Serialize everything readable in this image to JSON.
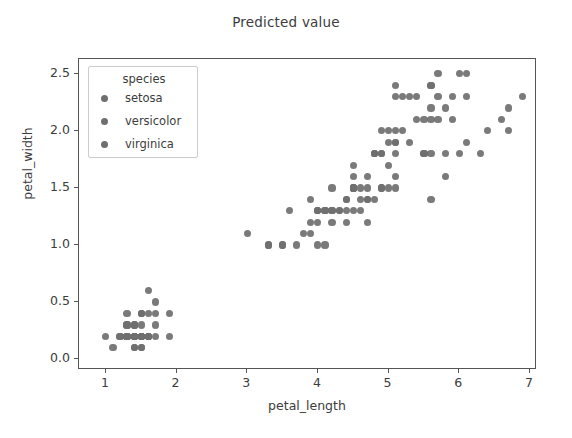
{
  "chart_data": {
    "type": "scatter",
    "title": "Predicted value",
    "xlabel": "petal_length",
    "ylabel": "petal_width",
    "xlim": [
      0.62,
      7.1
    ],
    "ylim": [
      -0.095,
      2.63
    ],
    "xticks": [
      "1",
      "2",
      "3",
      "4",
      "5",
      "6",
      "7"
    ],
    "xtick_values": [
      1,
      2,
      3,
      4,
      5,
      6,
      7
    ],
    "yticks": [
      "0.0",
      "0.5",
      "1.0",
      "1.5",
      "2.0",
      "2.5"
    ],
    "ytick_values": [
      0.0,
      0.5,
      1.0,
      1.5,
      2.0,
      2.5
    ],
    "grid": false,
    "legend_position": "upper left",
    "marker_color": "#6f6f6f",
    "series": [
      {
        "name": "setosa",
        "color": "#6f6f6f",
        "x": [
          1.4,
          1.4,
          1.3,
          1.5,
          1.4,
          1.7,
          1.4,
          1.5,
          1.4,
          1.5,
          1.5,
          1.6,
          1.4,
          1.1,
          1.2,
          1.5,
          1.3,
          1.4,
          1.7,
          1.5,
          1.7,
          1.5,
          1.0,
          1.7,
          1.9,
          1.6,
          1.6,
          1.5,
          1.4,
          1.6,
          1.6,
          1.5,
          1.5,
          1.4,
          1.5,
          1.2,
          1.3,
          1.4,
          1.3,
          1.5,
          1.3,
          1.3,
          1.3,
          1.6,
          1.9,
          1.4,
          1.6,
          1.4,
          1.5,
          1.4
        ],
        "y": [
          0.2,
          0.2,
          0.2,
          0.2,
          0.2,
          0.4,
          0.3,
          0.2,
          0.2,
          0.1,
          0.2,
          0.2,
          0.1,
          0.1,
          0.2,
          0.4,
          0.4,
          0.3,
          0.3,
          0.3,
          0.2,
          0.4,
          0.2,
          0.5,
          0.2,
          0.2,
          0.4,
          0.2,
          0.2,
          0.2,
          0.2,
          0.4,
          0.1,
          0.2,
          0.2,
          0.2,
          0.2,
          0.1,
          0.2,
          0.2,
          0.3,
          0.3,
          0.2,
          0.6,
          0.4,
          0.3,
          0.2,
          0.2,
          0.2,
          0.2
        ]
      },
      {
        "name": "versicolor",
        "color": "#6f6f6f",
        "x": [
          4.7,
          4.5,
          4.9,
          4.0,
          4.6,
          4.5,
          4.7,
          3.3,
          4.6,
          3.9,
          3.5,
          4.2,
          4.0,
          4.7,
          3.6,
          4.4,
          4.5,
          4.1,
          4.5,
          3.9,
          4.8,
          4.0,
          4.9,
          4.7,
          4.3,
          4.4,
          4.8,
          5.0,
          4.5,
          3.5,
          3.8,
          3.7,
          3.9,
          5.1,
          4.5,
          4.5,
          4.7,
          4.4,
          4.1,
          4.0,
          4.4,
          4.6,
          4.0,
          3.3,
          4.2,
          4.2,
          4.2,
          4.3,
          3.0,
          4.1
        ],
        "y": [
          1.4,
          1.5,
          1.5,
          1.3,
          1.5,
          1.3,
          1.6,
          1.0,
          1.3,
          1.4,
          1.0,
          1.5,
          1.0,
          1.4,
          1.3,
          1.4,
          1.5,
          1.0,
          1.5,
          1.1,
          1.8,
          1.3,
          1.5,
          1.2,
          1.3,
          1.4,
          1.4,
          1.7,
          1.5,
          1.0,
          1.1,
          1.0,
          1.2,
          1.6,
          1.5,
          1.6,
          1.5,
          1.3,
          1.3,
          1.3,
          1.2,
          1.4,
          1.2,
          1.0,
          1.3,
          1.2,
          1.3,
          1.3,
          1.1,
          1.3
        ]
      },
      {
        "name": "virginica",
        "color": "#6f6f6f",
        "x": [
          6.0,
          5.1,
          5.9,
          5.6,
          5.8,
          6.6,
          4.5,
          6.3,
          5.8,
          6.1,
          5.1,
          5.3,
          5.5,
          5.0,
          5.1,
          5.3,
          5.5,
          6.7,
          6.9,
          5.0,
          5.7,
          4.9,
          6.7,
          4.9,
          5.7,
          6.0,
          4.8,
          4.9,
          5.6,
          5.8,
          6.1,
          6.4,
          5.6,
          5.1,
          5.6,
          6.1,
          5.6,
          5.5,
          4.8,
          5.4,
          5.6,
          5.1,
          5.1,
          5.9,
          5.7,
          5.2,
          5.0,
          5.2,
          5.4,
          5.1
        ],
        "y": [
          2.5,
          1.9,
          2.1,
          1.8,
          2.2,
          2.1,
          1.7,
          1.8,
          1.8,
          2.5,
          2.0,
          1.9,
          2.1,
          2.0,
          2.4,
          2.3,
          1.8,
          2.2,
          2.3,
          1.5,
          2.3,
          2.0,
          2.0,
          1.8,
          2.1,
          1.8,
          1.8,
          1.8,
          2.1,
          1.6,
          1.9,
          2.0,
          2.2,
          1.5,
          1.4,
          2.3,
          2.4,
          1.8,
          1.8,
          2.1,
          2.4,
          2.3,
          1.9,
          2.3,
          2.5,
          2.3,
          1.9,
          2.0,
          2.3,
          1.8
        ]
      }
    ]
  },
  "legend": {
    "title": "species",
    "entries": [
      {
        "label": "setosa"
      },
      {
        "label": "versicolor"
      },
      {
        "label": "virginica"
      }
    ]
  }
}
